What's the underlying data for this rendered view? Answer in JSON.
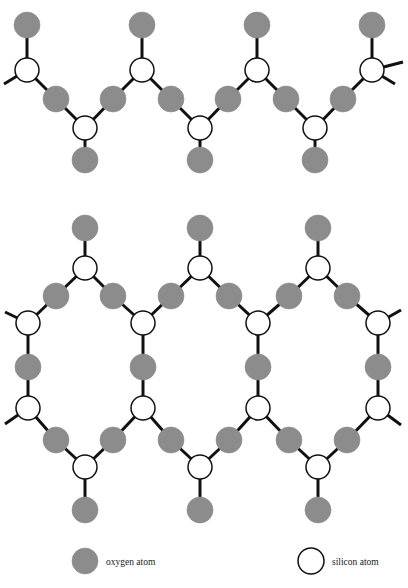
{
  "figure": {
    "background_color": "#ffffff"
  },
  "colors": {
    "oxygen_fill": "#8c8c8c",
    "oxygen_stroke": "#8c8c8c",
    "silicon_fill": "#ffffff",
    "silicon_stroke": "#111111",
    "bond_color": "#111111",
    "text_color": "#1a1a1a"
  },
  "atoms": {
    "oxygen_radius": 13,
    "silicon_radius": 12,
    "bond_width": 3
  },
  "legend": {
    "items": [
      {
        "key": "oxygen",
        "label": "oxygen atom",
        "marker": "filled-circle",
        "marker_cx": 85,
        "marker_cy": 561,
        "marker_r": 13,
        "label_x": 106,
        "label_y": 565
      },
      {
        "key": "silicon",
        "label": "silicon atom",
        "marker": "open-circle",
        "marker_cx": 311,
        "marker_cy": 561,
        "marker_r": 13,
        "label_x": 332,
        "label_y": 565
      }
    ]
  },
  "caption": {
    "text": "",
    "x": 204,
    "y": 584
  },
  "chain_structure": {
    "name": "single-chain-silicate",
    "silicons": [
      {
        "id": "c-si-t1",
        "x": 27,
        "y": 70
      },
      {
        "id": "c-si-t2",
        "x": 142,
        "y": 70
      },
      {
        "id": "c-si-t3",
        "x": 257,
        "y": 70
      },
      {
        "id": "c-si-t4",
        "x": 372,
        "y": 70
      },
      {
        "id": "c-si-b1",
        "x": 85,
        "y": 128
      },
      {
        "id": "c-si-b2",
        "x": 200,
        "y": 128
      },
      {
        "id": "c-si-b3",
        "x": 315,
        "y": 128
      }
    ],
    "oxygens": [
      {
        "id": "c-o-top1",
        "x": 27,
        "y": 25
      },
      {
        "id": "c-o-top2",
        "x": 142,
        "y": 25
      },
      {
        "id": "c-o-top3",
        "x": 257,
        "y": 25
      },
      {
        "id": "c-o-top4",
        "x": 372,
        "y": 25
      },
      {
        "id": "c-o-m1",
        "x": 56,
        "y": 99
      },
      {
        "id": "c-o-m2",
        "x": 113,
        "y": 99
      },
      {
        "id": "c-o-m3",
        "x": 171,
        "y": 99
      },
      {
        "id": "c-o-m4",
        "x": 228,
        "y": 99
      },
      {
        "id": "c-o-m5",
        "x": 286,
        "y": 99
      },
      {
        "id": "c-o-m6",
        "x": 343,
        "y": 99
      },
      {
        "id": "c-o-bot1",
        "x": 85,
        "y": 160
      },
      {
        "id": "c-o-bot2",
        "x": 200,
        "y": 160
      },
      {
        "id": "c-o-bot3",
        "x": 315,
        "y": 160
      }
    ],
    "bonds": [
      {
        "x1": 27,
        "y1": 70,
        "x2": 27,
        "y2": 25
      },
      {
        "x1": 142,
        "y1": 70,
        "x2": 142,
        "y2": 25
      },
      {
        "x1": 257,
        "y1": 70,
        "x2": 257,
        "y2": 25
      },
      {
        "x1": 372,
        "y1": 70,
        "x2": 372,
        "y2": 25
      },
      {
        "x1": 27,
        "y1": 70,
        "x2": 56,
        "y2": 99
      },
      {
        "x1": 142,
        "y1": 70,
        "x2": 113,
        "y2": 99
      },
      {
        "x1": 142,
        "y1": 70,
        "x2": 171,
        "y2": 99
      },
      {
        "x1": 257,
        "y1": 70,
        "x2": 228,
        "y2": 99
      },
      {
        "x1": 257,
        "y1": 70,
        "x2": 286,
        "y2": 99
      },
      {
        "x1": 372,
        "y1": 70,
        "x2": 343,
        "y2": 99
      },
      {
        "x1": 85,
        "y1": 128,
        "x2": 56,
        "y2": 99
      },
      {
        "x1": 85,
        "y1": 128,
        "x2": 113,
        "y2": 99
      },
      {
        "x1": 200,
        "y1": 128,
        "x2": 171,
        "y2": 99
      },
      {
        "x1": 200,
        "y1": 128,
        "x2": 228,
        "y2": 99
      },
      {
        "x1": 315,
        "y1": 128,
        "x2": 286,
        "y2": 99
      },
      {
        "x1": 315,
        "y1": 128,
        "x2": 343,
        "y2": 99
      },
      {
        "x1": 85,
        "y1": 128,
        "x2": 85,
        "y2": 160
      },
      {
        "x1": 200,
        "y1": 128,
        "x2": 200,
        "y2": 160
      },
      {
        "x1": 315,
        "y1": 128,
        "x2": 315,
        "y2": 160
      },
      {
        "x1": 27,
        "y1": 70,
        "x2": 4,
        "y2": 84
      },
      {
        "x1": 372,
        "y1": 70,
        "x2": 395,
        "y2": 84
      },
      {
        "x1": 372,
        "y1": 70,
        "x2": 403,
        "y2": 62
      }
    ]
  },
  "sheet_structure": {
    "name": "sheet-silicate",
    "silicons": [
      {
        "id": "s-si-r1c1",
        "x": 85,
        "y": 268
      },
      {
        "id": "s-si-r1c2",
        "x": 200,
        "y": 268
      },
      {
        "id": "s-si-r1c3",
        "x": 318,
        "y": 268
      },
      {
        "id": "s-si-r2c0",
        "x": 28,
        "y": 323
      },
      {
        "id": "s-si-r2c1",
        "x": 143,
        "y": 323
      },
      {
        "id": "s-si-r2c2",
        "x": 258,
        "y": 323
      },
      {
        "id": "s-si-r2c3",
        "x": 378,
        "y": 323
      },
      {
        "id": "s-si-r3c0",
        "x": 28,
        "y": 408
      },
      {
        "id": "s-si-r3c1",
        "x": 143,
        "y": 408
      },
      {
        "id": "s-si-r3c2",
        "x": 258,
        "y": 408
      },
      {
        "id": "s-si-r3c3",
        "x": 378,
        "y": 408
      },
      {
        "id": "s-si-r4c1",
        "x": 85,
        "y": 467
      },
      {
        "id": "s-si-r4c2",
        "x": 200,
        "y": 467
      },
      {
        "id": "s-si-r4c3",
        "x": 318,
        "y": 467
      }
    ],
    "oxygens": [
      {
        "id": "s-o-top1",
        "x": 85,
        "y": 228
      },
      {
        "id": "s-o-top2",
        "x": 200,
        "y": 228
      },
      {
        "id": "s-o-top3",
        "x": 318,
        "y": 228
      },
      {
        "id": "s-o-d1a",
        "x": 56,
        "y": 296
      },
      {
        "id": "s-o-d1b",
        "x": 113,
        "y": 296
      },
      {
        "id": "s-o-d2a",
        "x": 171,
        "y": 296
      },
      {
        "id": "s-o-d2b",
        "x": 229,
        "y": 296
      },
      {
        "id": "s-o-d3a",
        "x": 289,
        "y": 296
      },
      {
        "id": "s-o-d3b",
        "x": 347,
        "y": 296
      },
      {
        "id": "s-o-v1",
        "x": 28,
        "y": 367
      },
      {
        "id": "s-o-v2",
        "x": 143,
        "y": 367
      },
      {
        "id": "s-o-v3",
        "x": 258,
        "y": 367
      },
      {
        "id": "s-o-v4",
        "x": 378,
        "y": 367
      },
      {
        "id": "s-o-d4a",
        "x": 56,
        "y": 440
      },
      {
        "id": "s-o-d4b",
        "x": 113,
        "y": 440
      },
      {
        "id": "s-o-d5a",
        "x": 171,
        "y": 440
      },
      {
        "id": "s-o-d5b",
        "x": 229,
        "y": 440
      },
      {
        "id": "s-o-d6a",
        "x": 289,
        "y": 440
      },
      {
        "id": "s-o-d6b",
        "x": 347,
        "y": 440
      },
      {
        "id": "s-o-bot1",
        "x": 85,
        "y": 510
      },
      {
        "id": "s-o-bot2",
        "x": 200,
        "y": 510
      },
      {
        "id": "s-o-bot3",
        "x": 318,
        "y": 510
      }
    ],
    "bonds": [
      {
        "x1": 85,
        "y1": 268,
        "x2": 85,
        "y2": 228
      },
      {
        "x1": 200,
        "y1": 268,
        "x2": 200,
        "y2": 228
      },
      {
        "x1": 318,
        "y1": 268,
        "x2": 318,
        "y2": 228
      },
      {
        "x1": 85,
        "y1": 268,
        "x2": 56,
        "y2": 296
      },
      {
        "x1": 85,
        "y1": 268,
        "x2": 113,
        "y2": 296
      },
      {
        "x1": 200,
        "y1": 268,
        "x2": 171,
        "y2": 296
      },
      {
        "x1": 200,
        "y1": 268,
        "x2": 229,
        "y2": 296
      },
      {
        "x1": 318,
        "y1": 268,
        "x2": 289,
        "y2": 296
      },
      {
        "x1": 318,
        "y1": 268,
        "x2": 347,
        "y2": 296
      },
      {
        "x1": 28,
        "y1": 323,
        "x2": 56,
        "y2": 296
      },
      {
        "x1": 143,
        "y1": 323,
        "x2": 113,
        "y2": 296
      },
      {
        "x1": 143,
        "y1": 323,
        "x2": 171,
        "y2": 296
      },
      {
        "x1": 258,
        "y1": 323,
        "x2": 229,
        "y2": 296
      },
      {
        "x1": 258,
        "y1": 323,
        "x2": 289,
        "y2": 296
      },
      {
        "x1": 378,
        "y1": 323,
        "x2": 347,
        "y2": 296
      },
      {
        "x1": 28,
        "y1": 323,
        "x2": 5,
        "y2": 312
      },
      {
        "x1": 378,
        "y1": 323,
        "x2": 401,
        "y2": 310
      },
      {
        "x1": 28,
        "y1": 323,
        "x2": 28,
        "y2": 367
      },
      {
        "x1": 143,
        "y1": 323,
        "x2": 143,
        "y2": 367
      },
      {
        "x1": 258,
        "y1": 323,
        "x2": 258,
        "y2": 367
      },
      {
        "x1": 378,
        "y1": 323,
        "x2": 378,
        "y2": 367
      },
      {
        "x1": 28,
        "y1": 408,
        "x2": 28,
        "y2": 367
      },
      {
        "x1": 143,
        "y1": 408,
        "x2": 143,
        "y2": 367
      },
      {
        "x1": 258,
        "y1": 408,
        "x2": 258,
        "y2": 367
      },
      {
        "x1": 378,
        "y1": 408,
        "x2": 378,
        "y2": 367
      },
      {
        "x1": 28,
        "y1": 408,
        "x2": 56,
        "y2": 440
      },
      {
        "x1": 143,
        "y1": 408,
        "x2": 113,
        "y2": 440
      },
      {
        "x1": 143,
        "y1": 408,
        "x2": 171,
        "y2": 440
      },
      {
        "x1": 258,
        "y1": 408,
        "x2": 229,
        "y2": 440
      },
      {
        "x1": 258,
        "y1": 408,
        "x2": 289,
        "y2": 440
      },
      {
        "x1": 378,
        "y1": 408,
        "x2": 347,
        "y2": 440
      },
      {
        "x1": 28,
        "y1": 408,
        "x2": 5,
        "y2": 424
      },
      {
        "x1": 378,
        "y1": 408,
        "x2": 401,
        "y2": 425
      },
      {
        "x1": 85,
        "y1": 467,
        "x2": 56,
        "y2": 440
      },
      {
        "x1": 85,
        "y1": 467,
        "x2": 113,
        "y2": 440
      },
      {
        "x1": 200,
        "y1": 467,
        "x2": 171,
        "y2": 440
      },
      {
        "x1": 200,
        "y1": 467,
        "x2": 229,
        "y2": 440
      },
      {
        "x1": 318,
        "y1": 467,
        "x2": 289,
        "y2": 440
      },
      {
        "x1": 318,
        "y1": 467,
        "x2": 347,
        "y2": 440
      },
      {
        "x1": 85,
        "y1": 467,
        "x2": 85,
        "y2": 510
      },
      {
        "x1": 200,
        "y1": 467,
        "x2": 200,
        "y2": 510
      },
      {
        "x1": 318,
        "y1": 467,
        "x2": 318,
        "y2": 510
      }
    ]
  }
}
